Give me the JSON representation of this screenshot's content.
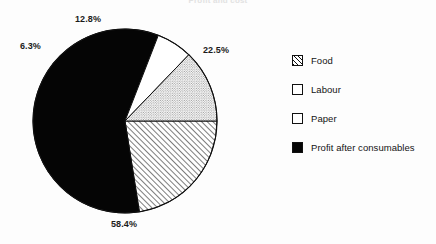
{
  "chart_title": "Profit and cost",
  "chart_data": {
    "type": "pie",
    "title": "Profit and cost",
    "categories": [
      "Food",
      "Labour",
      "Paper",
      "Profit after consumables"
    ],
    "values": [
      22.5,
      12.8,
      6.3,
      58.4
    ],
    "value_labels": [
      "22.5%",
      "12.8%",
      "6.3%",
      "58.4%"
    ],
    "units": "percent",
    "legend_position": "right",
    "grid": false,
    "slice_styles": [
      "diagonal-hatch",
      "dotted",
      "white",
      "solid-black"
    ],
    "start_angle_deg": 0,
    "direction": "clockwise"
  },
  "pie": {
    "center_x": 125,
    "center_y": 121,
    "radius": 92,
    "outline_color": "#111111",
    "slices": [
      {
        "name": "Food",
        "percent_label": "22.5%",
        "value": 22.5,
        "fill": "url(#hatch-pattern)",
        "style": "diagonal-hatch"
      },
      {
        "name": "Profit after consumables",
        "percent_label": "58.4%",
        "value": 58.4,
        "fill": "#050505",
        "style": "solid-black"
      },
      {
        "name": "Paper",
        "percent_label": "6.3%",
        "value": 6.3,
        "fill": "#ffffff",
        "style": "white"
      },
      {
        "name": "Labour",
        "percent_label": "12.8%",
        "value": 12.8,
        "fill": "url(#dots-pattern)",
        "style": "dotted"
      }
    ]
  },
  "labels": {
    "food": "22.5%",
    "labour": "12.8%",
    "paper": "6.3%",
    "profit": "58.4%"
  },
  "legend": {
    "items": [
      {
        "label": "Food",
        "swatch": "diagonal-hatch"
      },
      {
        "label": "Labour",
        "swatch": "dotted"
      },
      {
        "label": "Paper",
        "swatch": "white"
      },
      {
        "label": "Profit after consumables",
        "swatch": "solid-black"
      }
    ]
  },
  "colors": {
    "background": "#fdfdfd",
    "ink": "#111111",
    "black_slice": "#050505",
    "white_slice": "#ffffff"
  }
}
